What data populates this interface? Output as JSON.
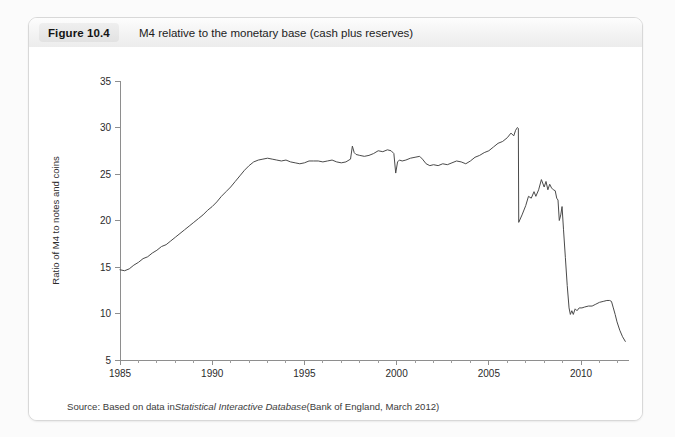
{
  "figure": {
    "number_label": "Figure 10.4",
    "caption": "M4 relative to the monetary base (cash plus reserves)",
    "source_prefix": "Source: Based on data in ",
    "source_italic": "Statistical Interactive Database",
    "source_suffix": " (Bank of England, March 2012)"
  },
  "chart_data": {
    "type": "line",
    "title": "M4 relative to the monetary base (cash plus reserves)",
    "xlabel": "",
    "ylabel": "Ratio of M4 to notes and coins",
    "xlim": [
      1985,
      2012.6
    ],
    "ylim": [
      5,
      35
    ],
    "xticks": [
      1985,
      1990,
      1995,
      2000,
      2005,
      2010
    ],
    "xtick_labels": [
      "1985",
      "1990",
      "1995",
      "2000",
      "2005",
      "2010"
    ],
    "yticks": [
      5,
      10,
      15,
      20,
      25,
      30,
      35
    ],
    "ytick_labels": [
      "5",
      "10",
      "15",
      "20",
      "25",
      "30",
      "35"
    ],
    "minor_xtick_step": 1,
    "grid": false,
    "legend": false,
    "line_color": "#4a4a4a",
    "series": [
      {
        "name": "Ratio of M4 to notes and coins",
        "points": [
          [
            1985.0,
            14.7
          ],
          [
            1985.25,
            14.6
          ],
          [
            1985.5,
            14.8
          ],
          [
            1985.75,
            15.2
          ],
          [
            1986.0,
            15.5
          ],
          [
            1986.25,
            15.9
          ],
          [
            1986.5,
            16.1
          ],
          [
            1986.75,
            16.5
          ],
          [
            1987.0,
            16.8
          ],
          [
            1987.25,
            17.2
          ],
          [
            1987.5,
            17.4
          ],
          [
            1987.75,
            17.8
          ],
          [
            1988.0,
            18.2
          ],
          [
            1988.25,
            18.6
          ],
          [
            1988.5,
            19.0
          ],
          [
            1988.75,
            19.4
          ],
          [
            1989.0,
            19.8
          ],
          [
            1989.25,
            20.2
          ],
          [
            1989.5,
            20.6
          ],
          [
            1989.75,
            21.1
          ],
          [
            1990.0,
            21.5
          ],
          [
            1990.25,
            22.0
          ],
          [
            1990.5,
            22.6
          ],
          [
            1990.75,
            23.1
          ],
          [
            1991.0,
            23.6
          ],
          [
            1991.25,
            24.2
          ],
          [
            1991.5,
            24.8
          ],
          [
            1991.75,
            25.4
          ],
          [
            1992.0,
            25.9
          ],
          [
            1992.25,
            26.3
          ],
          [
            1992.5,
            26.5
          ],
          [
            1992.75,
            26.6
          ],
          [
            1993.0,
            26.7
          ],
          [
            1993.25,
            26.6
          ],
          [
            1993.5,
            26.5
          ],
          [
            1993.75,
            26.4
          ],
          [
            1994.0,
            26.5
          ],
          [
            1994.25,
            26.3
          ],
          [
            1994.5,
            26.2
          ],
          [
            1994.75,
            26.1
          ],
          [
            1995.0,
            26.2
          ],
          [
            1995.25,
            26.4
          ],
          [
            1995.5,
            26.4
          ],
          [
            1995.75,
            26.4
          ],
          [
            1996.0,
            26.3
          ],
          [
            1996.25,
            26.4
          ],
          [
            1996.5,
            26.5
          ],
          [
            1996.75,
            26.3
          ],
          [
            1997.0,
            26.2
          ],
          [
            1997.25,
            26.3
          ],
          [
            1997.5,
            26.6
          ],
          [
            1997.6,
            28.0
          ],
          [
            1997.7,
            27.3
          ],
          [
            1997.8,
            27.1
          ],
          [
            1998.0,
            27.0
          ],
          [
            1998.25,
            26.9
          ],
          [
            1998.5,
            27.0
          ],
          [
            1998.75,
            27.2
          ],
          [
            1999.0,
            27.5
          ],
          [
            1999.25,
            27.4
          ],
          [
            1999.5,
            27.6
          ],
          [
            1999.7,
            27.5
          ],
          [
            1999.85,
            27.2
          ],
          [
            1999.95,
            25.1
          ],
          [
            2000.05,
            26.3
          ],
          [
            2000.15,
            26.5
          ],
          [
            2000.3,
            26.4
          ],
          [
            2000.5,
            26.5
          ],
          [
            2000.75,
            26.7
          ],
          [
            2001.0,
            26.8
          ],
          [
            2001.25,
            26.9
          ],
          [
            2001.4,
            26.6
          ],
          [
            2001.6,
            26.1
          ],
          [
            2001.8,
            25.9
          ],
          [
            2002.0,
            26.0
          ],
          [
            2002.25,
            25.9
          ],
          [
            2002.5,
            26.1
          ],
          [
            2002.75,
            26.0
          ],
          [
            2003.0,
            26.2
          ],
          [
            2003.25,
            26.4
          ],
          [
            2003.5,
            26.3
          ],
          [
            2003.75,
            26.1
          ],
          [
            2004.0,
            26.4
          ],
          [
            2004.25,
            26.8
          ],
          [
            2004.5,
            27.0
          ],
          [
            2004.75,
            27.3
          ],
          [
            2005.0,
            27.5
          ],
          [
            2005.25,
            27.9
          ],
          [
            2005.5,
            28.3
          ],
          [
            2005.75,
            28.5
          ],
          [
            2006.0,
            28.9
          ],
          [
            2006.2,
            29.4
          ],
          [
            2006.35,
            29.1
          ],
          [
            2006.45,
            29.7
          ],
          [
            2006.55,
            30.0
          ],
          [
            2006.6,
            29.9
          ],
          [
            2006.62,
            19.8
          ],
          [
            2006.8,
            20.6
          ],
          [
            2007.0,
            21.6
          ],
          [
            2007.15,
            22.6
          ],
          [
            2007.3,
            22.4
          ],
          [
            2007.45,
            23.1
          ],
          [
            2007.55,
            22.6
          ],
          [
            2007.7,
            23.3
          ],
          [
            2007.85,
            24.4
          ],
          [
            2008.0,
            23.6
          ],
          [
            2008.1,
            24.2
          ],
          [
            2008.2,
            23.3
          ],
          [
            2008.3,
            23.9
          ],
          [
            2008.4,
            23.5
          ],
          [
            2008.5,
            23.3
          ],
          [
            2008.6,
            23.2
          ],
          [
            2008.68,
            22.4
          ],
          [
            2008.75,
            22.2
          ],
          [
            2008.82,
            20.0
          ],
          [
            2008.9,
            20.6
          ],
          [
            2008.97,
            21.5
          ],
          [
            2009.05,
            19.0
          ],
          [
            2009.15,
            16.0
          ],
          [
            2009.25,
            13.0
          ],
          [
            2009.35,
            10.6
          ],
          [
            2009.42,
            9.9
          ],
          [
            2009.5,
            10.3
          ],
          [
            2009.58,
            9.9
          ],
          [
            2009.68,
            10.5
          ],
          [
            2009.78,
            10.3
          ],
          [
            2009.9,
            10.6
          ],
          [
            2010.05,
            10.6
          ],
          [
            2010.2,
            10.7
          ],
          [
            2010.4,
            10.8
          ],
          [
            2010.6,
            10.8
          ],
          [
            2010.8,
            11.0
          ],
          [
            2011.0,
            11.2
          ],
          [
            2011.2,
            11.3
          ],
          [
            2011.4,
            11.4
          ],
          [
            2011.55,
            11.4
          ],
          [
            2011.65,
            11.3
          ],
          [
            2011.75,
            10.6
          ],
          [
            2011.85,
            9.9
          ],
          [
            2011.95,
            9.1
          ],
          [
            2012.1,
            8.2
          ],
          [
            2012.25,
            7.5
          ],
          [
            2012.4,
            7.0
          ]
        ]
      }
    ]
  }
}
